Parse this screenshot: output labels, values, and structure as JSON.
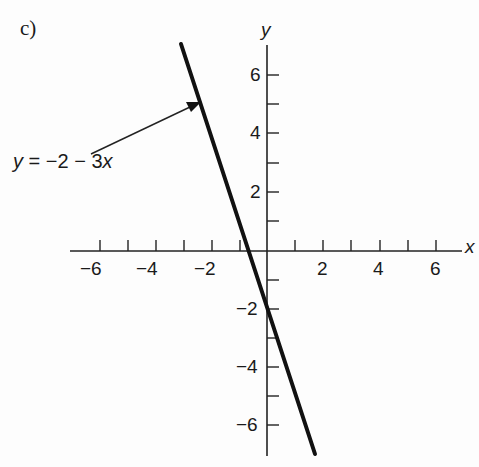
{
  "figure": {
    "part_label": "c)",
    "equation_label": "y = −2 − 3x"
  },
  "chart_data": {
    "type": "line",
    "title": "",
    "xlabel": "x",
    "ylabel": "y",
    "xlim": [
      -6.5,
      7
    ],
    "ylim": [
      -7,
      7
    ],
    "grid": false,
    "x_ticks": [
      -6,
      -5,
      -4,
      -3,
      -2,
      -1,
      1,
      2,
      3,
      4,
      5,
      6
    ],
    "x_tick_labels": [
      "−6",
      "−4",
      "−2",
      "2",
      "4",
      "6"
    ],
    "y_ticks": [
      -6,
      -5,
      -4,
      -3,
      -2,
      -1,
      1,
      2,
      3,
      4,
      5,
      6
    ],
    "y_tick_labels": [
      "6",
      "4",
      "2",
      "−2",
      "−4",
      "−6"
    ],
    "series": [
      {
        "name": "y = −2 − 3x",
        "equation": "y = -2 - 3x",
        "x": [
          -3,
          1.6667
        ],
        "y": [
          7,
          -7
        ]
      }
    ],
    "annotations": [
      {
        "text": "y = −2 − 3x",
        "arrow_to": {
          "x": -2.4,
          "y": 5.2
        }
      }
    ],
    "intercepts": {
      "y_intercept": -2,
      "x_intercept": -0.6667
    }
  },
  "labels": {
    "x_axis": "x",
    "y_axis": "y",
    "xticks": [
      "−6",
      "−4",
      "−2",
      "2",
      "4",
      "6"
    ],
    "yticks": [
      "6",
      "4",
      "2",
      "−2",
      "−4",
      "−6"
    ]
  }
}
